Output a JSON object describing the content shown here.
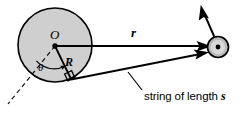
{
  "figure": {
    "labels": {
      "center": "O",
      "cylinder_radius": "R",
      "position_vector": "r",
      "angle": "θ",
      "string_caption_prefix": "string of length ",
      "string_caption_symbol": "s"
    },
    "colors": {
      "stroke": "#000000",
      "cylinder_fill": "#cfcfcf",
      "ball_fill": "#b9b9b9",
      "ball_inner_fill": "#d8d8d8",
      "background": "#ffffff"
    },
    "geometry": {
      "cylinder": {
        "cx": 55,
        "cy": 45,
        "r": 37
      },
      "center_dot": {
        "cx": 55,
        "cy": 46,
        "r": 2.6
      },
      "ball": {
        "cx": 218,
        "cy": 47,
        "r": 11
      },
      "tangent_point": {
        "x": 71,
        "y": 79
      },
      "r_vector": {
        "x1": 55,
        "y1": 46,
        "x2": 212,
        "y2": 46
      },
      "string": {
        "x1": 71,
        "y1": 79,
        "x2": 208,
        "y2": 52
      },
      "velocity_vector": {
        "x1": 216,
        "y1": 40,
        "x2": 201,
        "y2": 5
      },
      "dashed_reference": {
        "x1": 55,
        "y1": 46,
        "x2": 8,
        "y2": 104
      },
      "theta_arc_radius": 24,
      "right_angle_marker_size": 7
    }
  }
}
